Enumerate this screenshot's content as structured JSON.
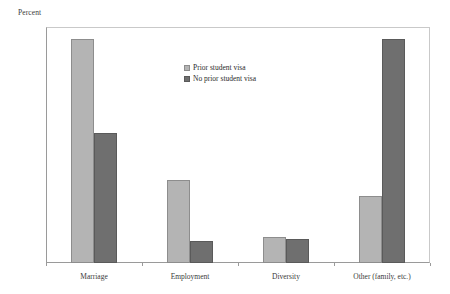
{
  "chart_data": {
    "type": "bar",
    "title": "",
    "subtitle": "",
    "xlabel": "",
    "ylabel": "Percent",
    "ylim": [
      0,
      60
    ],
    "yticks": [
      0,
      10,
      20,
      30,
      40,
      50,
      60
    ],
    "grid": false,
    "legend_position": "inside-top-center",
    "categories": [
      "Marriage",
      "Employment",
      "Diversity",
      "Other (family, etc.)"
    ],
    "series": [
      {
        "name": "Prior student visa",
        "color": "#b4b4b4",
        "values": [
          57,
          21,
          6.5,
          17
        ]
      },
      {
        "name": "No prior student visa",
        "color": "#6f6f6f",
        "values": [
          33,
          5.7,
          6,
          57
        ]
      }
    ]
  },
  "axes": {
    "y_title": "Percent",
    "y_tick_labels": [
      "60",
      "50",
      "40",
      "30",
      "20",
      "10",
      "0"
    ],
    "x_tick_labels": [
      "Marriage",
      "Employment",
      "Diversity",
      "Other (family, etc.)"
    ]
  },
  "legend": {
    "items": [
      {
        "label": "Prior student visa",
        "swatch": "legend-swatch-prior"
      },
      {
        "label": "No prior student visa",
        "swatch": "legend-swatch-noprior"
      }
    ]
  }
}
